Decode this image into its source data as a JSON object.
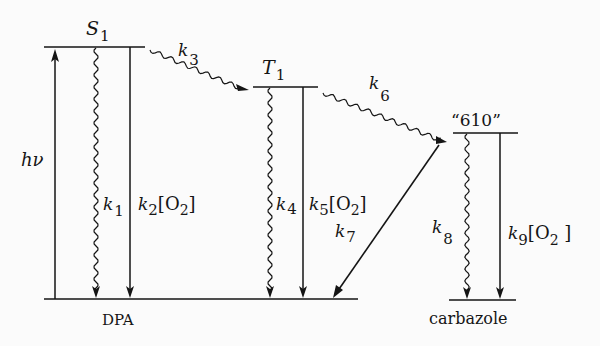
{
  "diagram": {
    "type": "energy-level-diagram",
    "levels": {
      "s1": {
        "label": "S",
        "sub": "1"
      },
      "t1": {
        "label": "T",
        "sub": "1"
      },
      "x610": {
        "label": "“610”"
      },
      "dpa": {
        "label": "DPA"
      },
      "carbazole": {
        "label": "carbazole"
      }
    },
    "transitions": {
      "hv": {
        "label": "hν"
      },
      "k1": {
        "k": "k",
        "sub": "1"
      },
      "k2": {
        "k": "k",
        "sub": "2",
        "o2": "[O",
        "o2sub": "2",
        "close": "]"
      },
      "k3": {
        "k": "k",
        "sub": "3"
      },
      "k4": {
        "k": "k",
        "sub": "4"
      },
      "k5": {
        "k": "k",
        "sub": "5",
        "o2": "[O",
        "o2sub": "2",
        "close": "]"
      },
      "k6": {
        "k": "k",
        "sub": "6"
      },
      "k7": {
        "k": "k",
        "sub": "7"
      },
      "k8": {
        "k": "k",
        "sub": "8"
      },
      "k9": {
        "k": "k",
        "sub": "9",
        "o2": "[O",
        "o2sub": "2",
        "close": " ]"
      }
    }
  }
}
